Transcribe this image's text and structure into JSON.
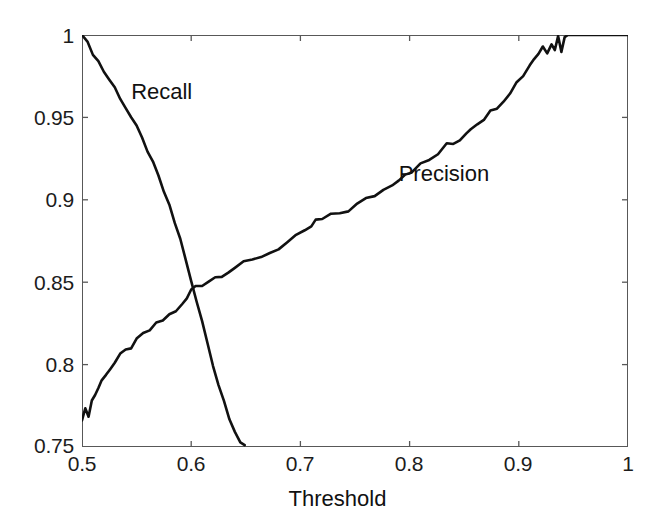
{
  "chart_data": {
    "type": "line",
    "title": "",
    "xlabel": "Threshold",
    "ylabel": "",
    "xlim": [
      0.5,
      1.0
    ],
    "ylim": [
      0.75,
      1.0
    ],
    "grid": false,
    "legend_position": "inline-annotations",
    "xticks": [
      "0.5",
      "0.6",
      "0.7",
      "0.8",
      "0.9",
      "1"
    ],
    "xtick_values": [
      0.5,
      0.6,
      0.7,
      0.8,
      0.9,
      1.0
    ],
    "yticks": [
      "0.75",
      "0.8",
      "0.85",
      "0.9",
      "0.95",
      "1"
    ],
    "ytick_values": [
      0.75,
      0.8,
      0.85,
      0.9,
      0.95,
      1.0
    ],
    "line_color": "#111111",
    "series": [
      {
        "name": "Recall",
        "x": [
          0.5,
          0.505,
          0.51,
          0.515,
          0.52,
          0.525,
          0.53,
          0.535,
          0.54,
          0.545,
          0.55,
          0.555,
          0.56,
          0.565,
          0.57,
          0.575,
          0.58,
          0.585,
          0.59,
          0.595,
          0.6,
          0.605,
          0.61,
          0.615,
          0.62,
          0.625,
          0.63,
          0.635,
          0.64,
          0.645,
          0.649
        ],
        "values": [
          1.0,
          0.995,
          0.989,
          0.984,
          0.978,
          0.973,
          0.968,
          0.962,
          0.956,
          0.95,
          0.944,
          0.937,
          0.93,
          0.922,
          0.914,
          0.905,
          0.896,
          0.886,
          0.876,
          0.864,
          0.85,
          0.838,
          0.826,
          0.813,
          0.8,
          0.788,
          0.778,
          0.768,
          0.76,
          0.753,
          0.75
        ]
      },
      {
        "name": "Precision",
        "x": [
          0.5,
          0.503,
          0.506,
          0.509,
          0.512,
          0.515,
          0.518,
          0.522,
          0.526,
          0.53,
          0.535,
          0.54,
          0.545,
          0.55,
          0.556,
          0.562,
          0.568,
          0.574,
          0.58,
          0.586,
          0.592,
          0.596,
          0.6,
          0.604,
          0.61,
          0.616,
          0.622,
          0.628,
          0.634,
          0.64,
          0.648,
          0.656,
          0.664,
          0.672,
          0.68,
          0.688,
          0.696,
          0.704,
          0.71,
          0.714,
          0.72,
          0.728,
          0.736,
          0.744,
          0.752,
          0.76,
          0.768,
          0.776,
          0.784,
          0.79,
          0.796,
          0.802,
          0.81,
          0.818,
          0.826,
          0.834,
          0.84,
          0.846,
          0.852,
          0.856,
          0.862,
          0.868,
          0.874,
          0.88,
          0.886,
          0.892,
          0.898,
          0.904,
          0.91,
          0.914,
          0.918,
          0.922,
          0.926,
          0.93,
          0.933,
          0.936,
          0.939,
          0.942,
          0.945,
          0.95,
          0.956,
          0.962,
          0.968,
          0.974,
          0.98,
          0.986,
          0.992,
          1.0
        ],
        "values": [
          0.768,
          0.772,
          0.77,
          0.778,
          0.782,
          0.786,
          0.79,
          0.795,
          0.798,
          0.801,
          0.805,
          0.808,
          0.811,
          0.814,
          0.818,
          0.821,
          0.824,
          0.827,
          0.83,
          0.833,
          0.836,
          0.84,
          0.845,
          0.848,
          0.849,
          0.851,
          0.853,
          0.855,
          0.857,
          0.859,
          0.861,
          0.863,
          0.866,
          0.868,
          0.871,
          0.874,
          0.877,
          0.88,
          0.884,
          0.887,
          0.888,
          0.89,
          0.892,
          0.894,
          0.897,
          0.9,
          0.903,
          0.906,
          0.91,
          0.913,
          0.916,
          0.918,
          0.921,
          0.924,
          0.928,
          0.933,
          0.934,
          0.937,
          0.941,
          0.944,
          0.947,
          0.95,
          0.953,
          0.957,
          0.961,
          0.966,
          0.971,
          0.976,
          0.982,
          0.986,
          0.989,
          0.993,
          0.99,
          0.996,
          0.992,
          0.999,
          0.991,
          0.998,
          1.0,
          1.0,
          1.0,
          1.0,
          1.0,
          1.0,
          1.0,
          1.0,
          1.0,
          1.0
        ]
      }
    ],
    "annotations": [
      {
        "text": "Recall",
        "x": 0.545,
        "y": 0.965
      },
      {
        "text": "Precision",
        "x": 0.79,
        "y": 0.915
      }
    ],
    "crossover": {
      "x": 0.6,
      "y": 0.85
    }
  },
  "axis": {
    "xlabel": "Threshold",
    "xticks": [
      "0.5",
      "0.6",
      "0.7",
      "0.8",
      "0.9",
      "1"
    ],
    "yticks": [
      "1",
      "0.95",
      "0.9",
      "0.85",
      "0.8",
      "0.75"
    ]
  },
  "labels": {
    "recall": "Recall",
    "precision": "Precision"
  }
}
